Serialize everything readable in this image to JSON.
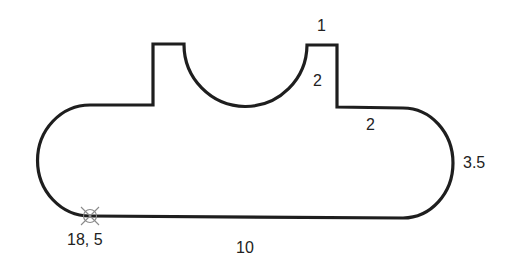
{
  "diagram": {
    "type": "profile-outline",
    "stroke_color": "#1e1e1e",
    "marker_color": "#8a8a8a",
    "dimensions": {
      "tab_width": "1",
      "tab_height": "2",
      "shoulder_length": "2",
      "end_radius": "3.5",
      "bottom_length": "10",
      "start_point": "18, 5"
    },
    "start_marker": {
      "icon": "crossed-circle-icon",
      "label": "18, 5"
    }
  }
}
